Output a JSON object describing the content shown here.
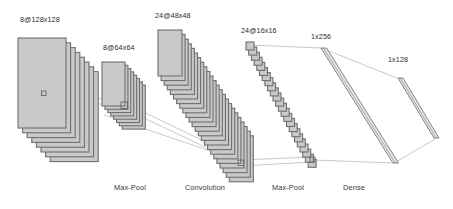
{
  "diagram": {
    "kind": "cnn-architecture",
    "background_color": "#ffffff",
    "plane_fill": "#c9c9c9",
    "plane_stroke": "#6f6f6f",
    "slab_fill": "#e8e8e8",
    "slab_stroke": "#777777",
    "line_color": "#9a9a9a",
    "receptive_box_stroke": "#5a5a5a",
    "text_color": "#2b2b2b"
  },
  "layer_labels": [
    {
      "id": "input-label",
      "text": "8@128x128",
      "x": 20,
      "y": 22
    },
    {
      "id": "pool1-label",
      "text": "8@64x64",
      "x": 103,
      "y": 50
    },
    {
      "id": "conv-label",
      "text": "24@48x48",
      "x": 155,
      "y": 18
    },
    {
      "id": "pool2-label",
      "text": "24@16x16",
      "x": 241,
      "y": 33
    },
    {
      "id": "dense1-label",
      "text": "1x256",
      "x": 311,
      "y": 39
    },
    {
      "id": "dense2-label",
      "text": "1x128",
      "x": 388,
      "y": 62
    }
  ],
  "stage_labels": [
    {
      "id": "stage-maxpool-1",
      "text": "Max-Pool",
      "x": 130,
      "y": 190
    },
    {
      "id": "stage-convolution",
      "text": "Convolution",
      "x": 205,
      "y": 190
    },
    {
      "id": "stage-maxpool-2",
      "text": "Max-Pool",
      "x": 288,
      "y": 190
    },
    {
      "id": "stage-dense",
      "text": "Dense",
      "x": 354,
      "y": 190
    }
  ],
  "layers": [
    {
      "id": "input-stack",
      "name": "input-feature-maps",
      "type": "plane-stack",
      "count": 8,
      "x": 18,
      "y": 38,
      "w": 48,
      "h": 90,
      "dx": 4.6,
      "dy": 4.8,
      "front_w": 48,
      "front_h": 90
    },
    {
      "id": "pool1-stack",
      "name": "maxpool-1-feature-maps",
      "type": "plane-stack",
      "count": 8,
      "x": 102,
      "y": 62,
      "w": 23,
      "h": 44,
      "dx": 2.9,
      "dy": 3.3,
      "front_w": 23,
      "front_h": 44
    },
    {
      "id": "conv-stack",
      "name": "convolution-feature-maps",
      "type": "plane-stack",
      "count": 24,
      "x": 158,
      "y": 30,
      "w": 24,
      "h": 46,
      "dx": 3.1,
      "dy": 4.6,
      "front_w": 24,
      "front_h": 46
    },
    {
      "id": "pool2-stack",
      "name": "maxpool-2-feature-maps",
      "type": "plane-stack",
      "count": 24,
      "x": 246,
      "y": 42,
      "w": 8,
      "h": 8,
      "dx": 2.7,
      "dy": 5.1,
      "front_w": 8,
      "front_h": 8
    }
  ],
  "dense_layers": [
    {
      "id": "dense-256",
      "name": "dense-256-slab",
      "label": "1x256",
      "top_x": 321,
      "top_y": 48,
      "bottom_x": 393,
      "bottom_y": 163,
      "thickness": 5.5
    },
    {
      "id": "dense-128",
      "name": "dense-128-slab",
      "label": "1x128",
      "top_x": 398,
      "top_y": 78,
      "bottom_x": 434,
      "bottom_y": 138,
      "thickness": 5.0
    }
  ],
  "receptive_fields": [
    {
      "id": "rf-input",
      "name": "receptive-field-input",
      "x": 41.5,
      "y": 91,
      "w": 4.5,
      "h": 4.5
    },
    {
      "id": "rf-pool1",
      "name": "receptive-field-pool1",
      "x": 121,
      "y": 102,
      "w": 6.5,
      "h": 6.5
    },
    {
      "id": "rf-conv",
      "name": "receptive-field-conv",
      "x": 238,
      "y": 160,
      "w": 5.5,
      "h": 5.5
    },
    {
      "id": "rf-pool2",
      "name": "receptive-field-pool2",
      "x": 310,
      "y": 157,
      "w": 5.0,
      "h": 5.0
    }
  ],
  "connections": [
    {
      "id": "c1",
      "name": "link-input-to-pool1-top",
      "x1": 46,
      "y1": 91.5,
      "x2": 127,
      "y2": 102.5
    },
    {
      "id": "c2",
      "name": "link-input-to-pool1-bottom",
      "x1": 46,
      "y1": 96,
      "x2": 127,
      "y2": 108
    },
    {
      "id": "c3",
      "name": "link-pool1-to-conv-top",
      "x1": 127,
      "y1": 104,
      "x2": 243,
      "y2": 160
    },
    {
      "id": "c4",
      "name": "link-pool1-to-conv-bottom",
      "x1": 127,
      "y1": 110,
      "x2": 243,
      "y2": 165
    },
    {
      "id": "c5",
      "name": "link-pool1-body-to-conv",
      "x1": 104,
      "y1": 115,
      "x2": 243,
      "y2": 162
    },
    {
      "id": "c6",
      "name": "link-conv-to-pool2-top",
      "x1": 243,
      "y1": 160,
      "x2": 311,
      "y2": 157
    },
    {
      "id": "c7",
      "name": "link-conv-to-pool2-bottom",
      "x1": 243,
      "y1": 166,
      "x2": 311,
      "y2": 162
    },
    {
      "id": "c8",
      "name": "link-pool2-top-to-dense1",
      "x1": 249,
      "y1": 45,
      "x2": 321,
      "y2": 48
    },
    {
      "id": "c9",
      "name": "link-pool2-bottom-to-dense1",
      "x1": 314,
      "y1": 160,
      "x2": 393,
      "y2": 163
    },
    {
      "id": "c10",
      "name": "link-dense1-top-to-dense2",
      "x1": 324,
      "y1": 49,
      "x2": 399,
      "y2": 79
    },
    {
      "id": "c11",
      "name": "link-dense1-bottom-to-dense2",
      "x1": 394,
      "y1": 163,
      "x2": 435,
      "y2": 139
    }
  ]
}
